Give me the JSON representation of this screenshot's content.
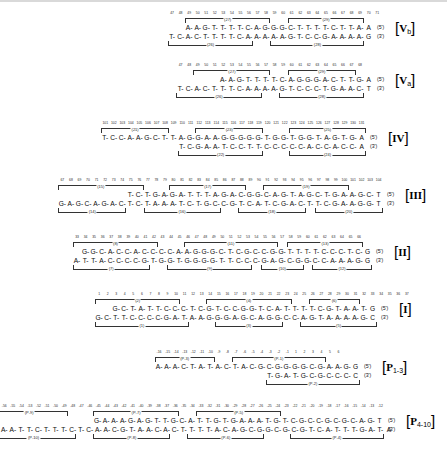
{
  "figure": {
    "type": "dna-sequence-panels",
    "background": "#ffffff",
    "ink": "#111111"
  },
  "panels": [
    {
      "id": "Vb",
      "tag_label": "Vb",
      "tag_roman": "V",
      "tag_suffix": "b",
      "numbers": [
        "47",
        "48",
        "49",
        "50",
        "51",
        "52",
        "53",
        "54",
        "55",
        "56",
        "57",
        "58",
        "59",
        "60",
        "61",
        "62",
        "63",
        "64",
        "65",
        "66",
        "67",
        "68",
        "69",
        "70",
        "71"
      ],
      "top_strand": "A-A-G-T-T-T-T-C-A-G-G-G-C-T-T-T-T-C-T-T-A-A",
      "top_end": "(5')",
      "bottom_strand": "T-C-A-C-T-T-T-T-C-A-A-A-A-A-G-T-C-C-G-A-A-A-A-G",
      "bottom_end": "(3')",
      "top_brackets": [
        {
          "label": "(27)",
          "start": 2,
          "span": 10
        },
        {
          "label": "(29)",
          "start": 14,
          "span": 9
        }
      ],
      "bottom_brackets": [
        {
          "label": "(26)",
          "start": 0,
          "span": 10
        },
        {
          "label": "(28)",
          "start": 12,
          "span": 11
        }
      ]
    },
    {
      "id": "Va",
      "tag_label": "Va",
      "tag_roman": "V",
      "tag_suffix": "a",
      "numbers": [
        "47",
        "48",
        "49",
        "50",
        "51",
        "52",
        "53",
        "54",
        "55",
        "56",
        "57",
        "58",
        "59",
        "60",
        "61",
        "62",
        "63",
        "64",
        "65",
        "66",
        "67",
        "68"
      ],
      "top_strand": "A-A-G-T-T-T-T-C-A-G-G-G-A-C-T-T-G-A",
      "top_end": "(5')",
      "bottom_strand": "T-C-A-C-T-T-T-C-A-A-A-A-G-T-C-C-C-T-G-A-A-C-T",
      "bottom_end": "(3')",
      "top_brackets": [
        {
          "label": "(27)",
          "start": 2,
          "span": 9
        },
        {
          "label": "(29)",
          "start": 13,
          "span": 8
        }
      ],
      "bottom_brackets": [
        {
          "label": "(26)",
          "start": 0,
          "span": 10
        },
        {
          "label": "(28)",
          "start": 12,
          "span": 10
        }
      ]
    },
    {
      "id": "IV",
      "tag_label": "IV",
      "tag_roman": "IV",
      "tag_suffix": "",
      "numbers": [
        "101",
        "102",
        "103",
        "104",
        "105",
        "106",
        "107",
        "108",
        "109",
        "110",
        "111",
        "112",
        "113",
        "114",
        "115",
        "116",
        "117",
        "118",
        "119",
        "120",
        "121",
        "122",
        "123",
        "124",
        "125",
        "126",
        "127",
        "128",
        "129",
        "130",
        "131"
      ],
      "top_strand": "T-C-C-A-A-G-C-T-T-A-G-G-A-A-G-G-G-G-G-T-G-G-T-G-G-T-A-G-T-G-A",
      "top_end": "(5')",
      "bottom_strand": "T-C-G-A-A-T-C-C-T-T-C-C-C-C-C-A-C-C-A-C-C-A",
      "bottom_end": "(3')",
      "top_brackets": [
        {
          "label": "(21)",
          "start": 0,
          "span": 8
        },
        {
          "label": "(23)",
          "start": 11,
          "span": 8
        },
        {
          "label": "(25)",
          "start": 22,
          "span": 9
        }
      ],
      "bottom_brackets": [
        {
          "label": "(22)",
          "start": 0,
          "span": 10
        },
        {
          "label": "(24)",
          "start": 13,
          "span": 9
        }
      ]
    },
    {
      "id": "III",
      "tag_label": "III",
      "tag_roman": "III",
      "tag_suffix": "",
      "numbers": [
        "67",
        "68",
        "69",
        "70",
        "71",
        "72",
        "73",
        "74",
        "75",
        "76",
        "77",
        "78",
        "79",
        "80",
        "81",
        "82",
        "83",
        "84",
        "85",
        "86",
        "87",
        "88",
        "89",
        "90",
        "91",
        "92",
        "93",
        "94",
        "95",
        "96",
        "97",
        "98",
        "99",
        "100",
        "101",
        "102",
        "103",
        "104"
      ],
      "top_strand": "T-C-T-G-A-G-A-T-T-T-A-G-A-C-G-G-C-A-G-T-A-G-C-T-G-A-A-G-C-T",
      "top_end": "(5')",
      "bottom_strand": "G-A-G-C-A-G-A-C-T-C-T-A-A-A-T-C-T-G-C-C-G-T-C-A-T-C-G-A-C-T-T-C-G-A-A-G-G-T",
      "bottom_end": "(3')",
      "top_brackets": [
        {
          "label": "(15)",
          "start": 0,
          "span": 10
        },
        {
          "label": "(17)",
          "start": 13,
          "span": 9
        },
        {
          "label": "(19)",
          "start": 24,
          "span": 10
        }
      ],
      "bottom_brackets": [
        {
          "label": "(14)",
          "start": 0,
          "span": 8
        },
        {
          "label": "(16)",
          "start": 10,
          "span": 9
        },
        {
          "label": "(18)",
          "start": 21,
          "span": 8
        },
        {
          "label": "(20)",
          "start": 30,
          "span": 8
        }
      ]
    },
    {
      "id": "II",
      "tag_label": "II",
      "tag_roman": "II",
      "tag_suffix": "",
      "numbers": [
        "33",
        "34",
        "35",
        "36",
        "37",
        "38",
        "39",
        "40",
        "41",
        "42",
        "43",
        "44",
        "45",
        "46",
        "47",
        "48",
        "49",
        "50",
        "51",
        "52",
        "53",
        "54",
        "55",
        "56",
        "57",
        "58",
        "59",
        "60",
        "61",
        "62",
        "63",
        "64",
        "65",
        "66"
      ],
      "top_strand": "G-G-C-A-C-C-A-C-C-C-C-A-A-G-G-G-C-T-C-G-C-C-G-G-T-T-T-T-C-C-C-T-C-G",
      "top_end": "(5')",
      "bottom_strand": "A-T-T-A-C-C-C-C-G-T-G-G-T-G-G-G-G-T-T-C-C-C-G-A-G-C-G-G-C-C-A-A-A-G-G",
      "bottom_end": "(3')",
      "top_brackets": [
        {
          "label": "(8)",
          "start": 0,
          "span": 10
        },
        {
          "label": "(11)",
          "start": 13,
          "span": 11
        },
        {
          "label": "(13)",
          "start": 25,
          "span": 9
        }
      ],
      "bottom_brackets": [
        {
          "label": "(7)",
          "start": 0,
          "span": 9
        },
        {
          "label": "(9)",
          "start": 11,
          "span": 10
        },
        {
          "label": "(10)",
          "start": 22,
          "span": 5
        },
        {
          "label": "(12)",
          "start": 28,
          "span": 7
        }
      ]
    },
    {
      "id": "I",
      "tag_label": "I",
      "tag_roman": "I",
      "tag_suffix": "",
      "numbers": [
        "1",
        "2",
        "3",
        "4",
        "5",
        "6",
        "7",
        "8",
        "9",
        "10",
        "11",
        "12",
        "13",
        "14",
        "15",
        "16",
        "17",
        "18",
        "19",
        "20",
        "21",
        "22",
        "23",
        "24",
        "25",
        "26",
        "27",
        "28",
        "29",
        "30",
        "31",
        "32",
        "33",
        "34",
        "35",
        "36",
        "37"
      ],
      "top_strand": "G-C-T-A-T-T-C-C-C-T-C-G-T-C-C-G-G-T-C-A-T-T-T-T-C-G-T-A-A-T-G",
      "top_end": "(5')",
      "bottom_strand": "G-C-T-T-C-C-C-C-G-A-T-A-A-G-G-G-A-G-C-A-G-G-C-C-A-G-T-A-A-A-A-G-C",
      "bottom_end": "(3')",
      "top_brackets": [
        {
          "label": "(2)",
          "start": 0,
          "span": 10
        },
        {
          "label": "(4)",
          "start": 13,
          "span": 10
        },
        {
          "label": "(6)",
          "start": 25,
          "span": 6
        }
      ],
      "bottom_brackets": [
        {
          "label": "(1)",
          "start": 0,
          "span": 11
        },
        {
          "label": "(3)",
          "start": 14,
          "span": 8
        },
        {
          "label": "(5)",
          "start": 24,
          "span": 9
        }
      ]
    },
    {
      "id": "P1-3",
      "tag_label": "P1-3",
      "tag_roman": "P",
      "tag_suffix": "1-3",
      "numbers": [
        "-16",
        "-15",
        "-14",
        "-13",
        "-12",
        "-11",
        "-10",
        "-9",
        "-8",
        "-7",
        "-6",
        "-5",
        "-4",
        "-3",
        "-2",
        "-1",
        "1",
        "2",
        "3",
        "4",
        "5",
        "6"
      ],
      "top_strand": "A-A-A-C-T-A-T-A-C-T-A-C-G-C-G-G-G-G-C-G-A-A-G-G",
      "top_end": "(5')",
      "bottom_strand": "T-G-A-T-G-C-G-C-C-C-C",
      "bottom_end": "(3')",
      "top_brackets": [
        {
          "label": "(P-3)",
          "start": 0,
          "span": 7
        },
        {
          "label": "(P-1)",
          "start": 9,
          "span": 11
        }
      ],
      "bottom_brackets": [
        {
          "label": "(P-2)",
          "start": 0,
          "span": 11
        }
      ]
    },
    {
      "id": "P4-10",
      "tag_label": "P4-10",
      "tag_roman": "P",
      "tag_suffix": "4-10",
      "numbers": [
        "-56",
        "-55",
        "-54",
        "-53",
        "-52",
        "-51",
        "-50",
        "-49",
        "-48",
        "-47",
        "-46",
        "-45",
        "-44",
        "-43",
        "-42",
        "-41",
        "-40",
        "-39",
        "-38",
        "-37",
        "-36",
        "-35",
        "-34",
        "-33",
        "-32",
        "-31",
        "-30",
        "-29",
        "-28",
        "-27",
        "-26",
        "-25",
        "-24",
        "-23",
        "-22",
        "-21",
        "-20",
        "-19",
        "-18",
        "-17",
        "-16",
        "-15",
        "-14",
        "-13",
        "-12"
      ],
      "top_strand": "G-A-A-A-G-A-G-T-T-G-C-A-T-T-G-T-G-A-A-A-T-G-T-C-G-C-C-G-C-G-C-A-G-T",
      "top_end": "(5')",
      "bottom_strand": "A-A-T-T-C-T-T-T-C-T-C-A-A-C-G-T-A-A-C-A-C-T-T-T-T-A-C-A-G-C-G-G-C-G-C-G-T-C-A-T-T-T-G-A-T-A",
      "bottom_end": "(3')",
      "top_brackets": [
        {
          "label": "(P-9)",
          "start": 0,
          "span": 9
        },
        {
          "label": "(P-7)",
          "start": 12,
          "span": 10
        },
        {
          "label": "(P-5)",
          "start": 24,
          "span": 10
        }
      ],
      "bottom_brackets": [
        {
          "label": "(P-10)",
          "start": 0,
          "span": 10
        },
        {
          "label": "(P-8)",
          "start": 12,
          "span": 9
        },
        {
          "label": "(P-6)",
          "start": 23,
          "span": 9
        },
        {
          "label": "(P-4)",
          "start": 35,
          "span": 11
        }
      ]
    }
  ]
}
